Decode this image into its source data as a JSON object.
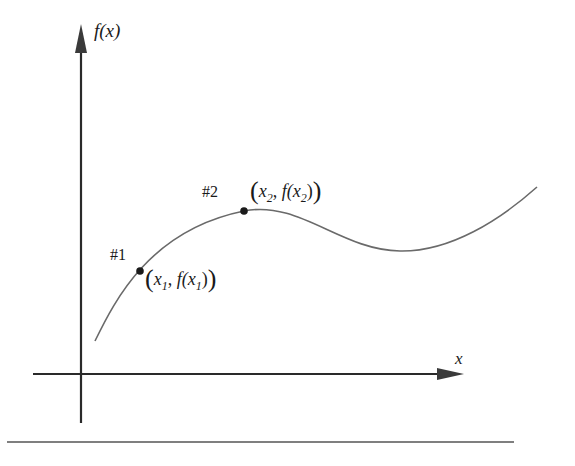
{
  "diagram": {
    "y_axis_label": "f(x)",
    "x_axis_label": "x",
    "points": [
      {
        "marker": "#1",
        "coordinate_label": {
          "open": "(",
          "var": "x",
          "sub": "1",
          "comma": ", ",
          "func": "f(x",
          "close_inner": ")",
          "close": ")"
        }
      },
      {
        "marker": "#2",
        "coordinate_label": {
          "open": "(",
          "var": "x",
          "sub": "2",
          "comma": ", ",
          "func": "f(x",
          "close_inner": ")",
          "close": ")"
        }
      }
    ],
    "colors": {
      "axes": "#2a2a2a",
      "curve": "#6a6a6a",
      "points": "#1a1a1a",
      "rule": "#555555"
    }
  }
}
